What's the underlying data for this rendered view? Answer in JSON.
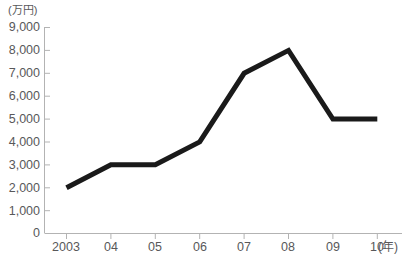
{
  "chart_data": {
    "type": "line",
    "title": "",
    "subtitle": "",
    "xlabel": "(年)",
    "ylabel": "(万円)",
    "x": [
      "2003",
      "04",
      "05",
      "06",
      "07",
      "08",
      "09",
      "10"
    ],
    "categories": [
      "2003",
      "04",
      "05",
      "06",
      "07",
      "08",
      "09",
      "10"
    ],
    "values": [
      2000,
      3000,
      3000,
      4000,
      7000,
      8000,
      5000,
      5000
    ],
    "series": [
      {
        "name": "金額",
        "values": [
          2000,
          3000,
          3000,
          4000,
          7000,
          8000,
          5000,
          5000
        ]
      }
    ],
    "ylim": [
      0,
      9000
    ],
    "ytick_labels": [
      "9,000",
      "8,000",
      "7,000",
      "6,000",
      "5,000",
      "4,000",
      "3,000",
      "2,000",
      "1,000",
      "0"
    ],
    "ytick_values": [
      9000,
      8000,
      7000,
      6000,
      5000,
      4000,
      3000,
      2000,
      1000,
      0
    ],
    "ystep": 1000,
    "grid": false,
    "legend": false,
    "legend_position": "none",
    "line_color": "#1a1a1a",
    "axis_color": "#b3b3b3",
    "text_color": "#58585a",
    "background_color": "#ffffff",
    "annotations": []
  },
  "axes": {
    "y_unit_label": "(万円)",
    "x_unit_label": "(年)"
  }
}
